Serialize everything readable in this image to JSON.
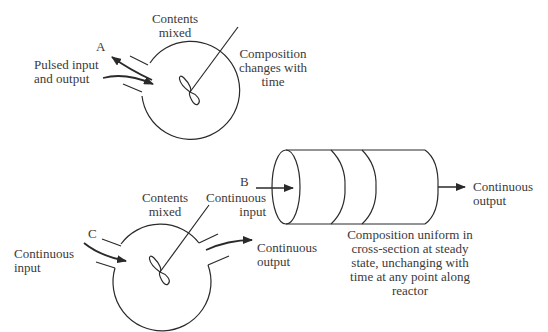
{
  "colors": {
    "line": "#2a2a2a",
    "text": "#3a3a3a",
    "background": "#ffffff"
  },
  "reactor_a": {
    "letter": "A",
    "flow_label": "Pulsed input\nand output",
    "mixing_label": "Contents\nmixed",
    "composition_label": "Composition\nchanges with\ntime"
  },
  "reactor_b": {
    "letter": "B",
    "input_label": "Continuous\ninput",
    "output_label": "Continuous\noutput",
    "composition_label": "Composition uniform in\ncross-section at steady\nstate, unchanging with\ntime at any point along\nreactor"
  },
  "reactor_c": {
    "letter": "C",
    "input_label": "Continuous\ninput",
    "mixing_label": "Contents\nmixed",
    "output_label": "Continuous\noutput"
  }
}
